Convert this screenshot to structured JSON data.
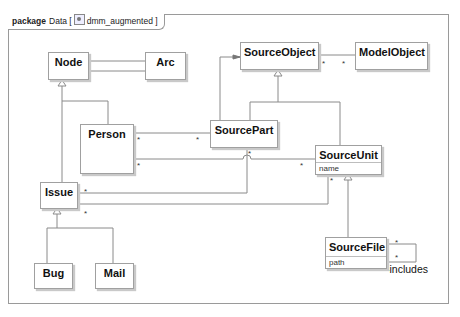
{
  "frame": {
    "keyword": "package",
    "name": "Data [",
    "icon": "model-icon",
    "model": "dmm_augmented ]"
  },
  "classes": {
    "node": {
      "name": "Node"
    },
    "arc": {
      "name": "Arc"
    },
    "source_object": {
      "name": "SourceObject"
    },
    "model_object": {
      "name": "ModelObject"
    },
    "person": {
      "name": "Person"
    },
    "source_part": {
      "name": "SourcePart"
    },
    "source_unit": {
      "name": "SourceUnit",
      "attributes": [
        "name"
      ]
    },
    "issue": {
      "name": "Issue"
    },
    "bug": {
      "name": "Bug"
    },
    "mail": {
      "name": "Mail"
    },
    "source_file": {
      "name": "SourceFile",
      "attributes": [
        "path"
      ]
    }
  },
  "multiplicities": {
    "many": "*"
  },
  "roles": {
    "includes": "-includes"
  }
}
